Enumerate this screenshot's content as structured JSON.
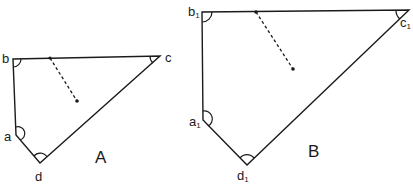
{
  "figures": [
    {
      "name": "A",
      "label": "A",
      "vertices": {
        "a": {
          "label": "a",
          "x": 16,
          "y": 135
        },
        "b": {
          "label": "b",
          "x": 13,
          "y": 59
        },
        "c": {
          "label": "c",
          "x": 160,
          "y": 56
        },
        "d": {
          "label": "d",
          "x": 40,
          "y": 163
        }
      },
      "dashed_line": {
        "from": [
          50,
          58
        ],
        "to": [
          77,
          101
        ]
      }
    },
    {
      "name": "B",
      "label": "B",
      "vertices": {
        "a": {
          "label": "a",
          "sub": "1",
          "x": 203,
          "y": 120
        },
        "b": {
          "label": "b",
          "sub": "1",
          "x": 202,
          "y": 12
        },
        "c": {
          "label": "c",
          "sub": "1",
          "x": 409,
          "y": 10
        },
        "d": {
          "label": "d",
          "sub": "1",
          "x": 247,
          "y": 165
        }
      },
      "dashed_line": {
        "from": [
          256,
          12
        ],
        "to": [
          293,
          69
        ]
      }
    }
  ],
  "colors": {
    "stroke": "#1a1a1a",
    "background": "#ffffff"
  }
}
